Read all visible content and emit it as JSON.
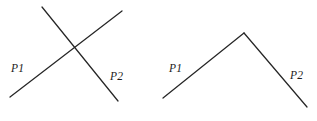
{
  "diagram": {
    "background_color": "#ffffff",
    "line_color": "#262626",
    "label_color": "#1b1b1b",
    "line_width": 1.25,
    "canvas": {
      "width": 317,
      "height": 121
    },
    "figures": [
      {
        "id": "left-figure",
        "name": "crossing-lines-figure",
        "description": "Two straight line segments crossing in an X",
        "segments": [
          {
            "id": "left-segment-p1",
            "name": "segment-p1",
            "x1": 10,
            "y1": 97,
            "x2": 122,
            "y2": 11,
            "direction": "ascending"
          },
          {
            "id": "left-segment-p2",
            "name": "segment-p2",
            "x1": 42,
            "y1": 7,
            "x2": 118,
            "y2": 101,
            "direction": "descending"
          }
        ],
        "intersection": {
          "x": 72,
          "y": 47
        },
        "labels": [
          {
            "id": "left-label-p1",
            "text": "P1",
            "x": 11,
            "y": 72
          },
          {
            "id": "left-label-p2",
            "text": "P2",
            "x": 110,
            "y": 80
          }
        ]
      },
      {
        "id": "right-figure",
        "name": "apex-lines-figure",
        "description": "Two straight line segments meeting at an apex forming an inverted V",
        "segments": [
          {
            "id": "right-segment-p1",
            "name": "segment-p1",
            "x1": 163,
            "y1": 98,
            "x2": 244,
            "y2": 33,
            "direction": "ascending"
          },
          {
            "id": "right-segment-p2",
            "name": "segment-p2",
            "x1": 244,
            "y1": 33,
            "x2": 307,
            "y2": 107,
            "direction": "descending"
          }
        ],
        "apex": {
          "x": 244,
          "y": 33
        },
        "labels": [
          {
            "id": "right-label-p1",
            "text": "P1",
            "x": 169,
            "y": 72
          },
          {
            "id": "right-label-p2",
            "text": "P2",
            "x": 290,
            "y": 79
          }
        ]
      }
    ]
  }
}
